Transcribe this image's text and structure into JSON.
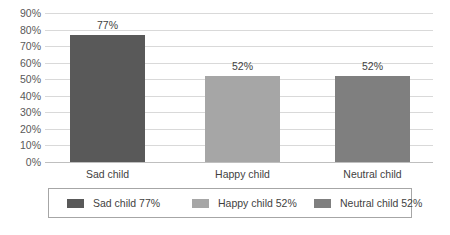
{
  "chart_data": {
    "type": "bar",
    "title": "",
    "subtitle": "",
    "xlabel": "",
    "ylabel": "",
    "categories": [
      "Sad child",
      "Happy child",
      "Neutral child"
    ],
    "values": [
      77,
      52,
      52
    ],
    "value_labels": [
      "77%",
      "52%",
      "52%"
    ],
    "ylim": [
      0,
      90
    ],
    "y_tick_labels": [
      "90%",
      "80%",
      "70%",
      "60%",
      "50%",
      "40%",
      "30%",
      "20%",
      "10%",
      "0%"
    ],
    "y_tick_values": [
      90,
      80,
      70,
      60,
      50,
      40,
      30,
      20,
      10,
      0
    ],
    "grid": true,
    "legend_position": "bottom",
    "legend": [
      {
        "label": "Sad child 77%",
        "color": "#595959"
      },
      {
        "label": "Happy child 52%",
        "color": "#a6a6a6"
      },
      {
        "label": "Neutral child 52%",
        "color": "#7f7f7f"
      }
    ],
    "bar_colors": [
      "#595959",
      "#a6a6a6",
      "#7f7f7f"
    ],
    "gridline_color": "#d9d9d9",
    "axis_color": "#bfbfbf",
    "background_color": "#ffffff",
    "text_color": "#3f3f3f"
  }
}
